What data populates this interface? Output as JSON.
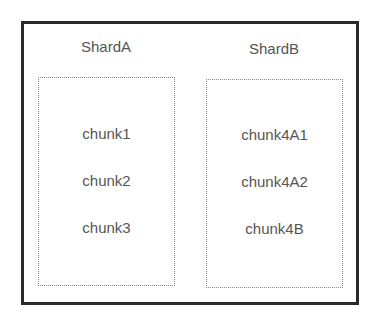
{
  "diagram": {
    "shards": [
      {
        "title": "ShardA",
        "chunks": [
          "chunk1",
          "chunk2",
          "chunk3"
        ]
      },
      {
        "title": "ShardB",
        "chunks": [
          "chunk4A1",
          "chunk4A2",
          "chunk4B"
        ]
      }
    ]
  }
}
